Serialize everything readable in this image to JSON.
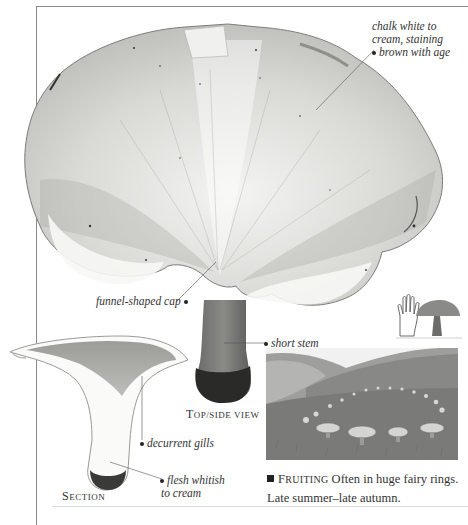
{
  "page": {
    "frame": {
      "line_color": "#8a8a8a"
    },
    "theme": {
      "ink": "#222222",
      "text": "#333333",
      "photo_tone": "grayscale"
    }
  },
  "illustration": {
    "main_view": {
      "subject": "mushroom-top-side-view",
      "caption_first": "T",
      "caption_rest": "OP/SIDE VIEW",
      "caption_full": "Top/side view"
    },
    "section_view": {
      "subject": "mushroom-cross-section",
      "caption_first": "S",
      "caption_rest": "ECTION",
      "caption_full": "Section"
    },
    "scale_icon": {
      "icons": [
        "hand-icon",
        "mushroom-icon"
      ],
      "meaning": "mushroom larger than a hand"
    },
    "habitat_photo": {
      "subject": "fairy-ring-on-grassy-hillside"
    }
  },
  "annotations": [
    {
      "id": "cap-color",
      "lines": [
        "chalk white to",
        "cream, staining",
        "brown with age"
      ]
    },
    {
      "id": "cap-shape",
      "lines": [
        "funnel-shaped cap"
      ]
    },
    {
      "id": "stem",
      "lines": [
        "short stem"
      ]
    },
    {
      "id": "gills",
      "lines": [
        "decurrent gills"
      ]
    },
    {
      "id": "flesh",
      "lines": [
        "flesh whitish",
        "to cream"
      ]
    }
  ],
  "fruiting": {
    "bullet": "square",
    "keyword_first": "F",
    "keyword_rest": "RUITING",
    "text": " Often in huge fairy rings. Late summer–late autumn."
  }
}
